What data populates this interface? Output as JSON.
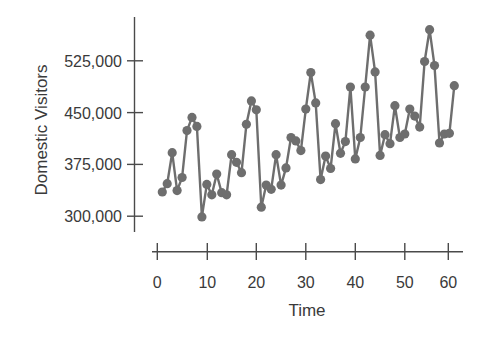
{
  "chart_data": {
    "type": "line",
    "title": "",
    "xlabel": "Time",
    "ylabel": "Domestic Visitors",
    "xlim": [
      0,
      60
    ],
    "ylim": [
      300000,
      525000
    ],
    "x_ticks": [
      0,
      10,
      20,
      30,
      40,
      50,
      60
    ],
    "x_tick_labels": [
      "0",
      "10",
      "20",
      "30",
      "40",
      "50",
      "60"
    ],
    "y_ticks": [
      300000,
      375000,
      450000,
      525000
    ],
    "y_tick_labels": [
      "300,000",
      "375,000",
      "450,000",
      "525,000"
    ],
    "grid": false,
    "legend": null,
    "markers": "circle",
    "series": [
      {
        "name": "Domestic Visitors",
        "color": "#6e6e6e",
        "x": [
          1,
          2,
          3,
          4,
          5,
          6,
          7,
          8,
          9,
          10,
          11,
          12,
          13,
          14,
          15,
          16,
          17,
          18,
          19,
          20,
          21,
          22,
          23,
          24,
          25,
          26,
          27,
          28,
          29,
          30,
          31,
          32,
          33,
          34,
          35,
          36,
          37,
          38,
          39,
          40,
          41,
          42,
          43,
          44,
          45,
          46,
          47,
          48,
          49,
          50,
          51,
          52,
          53,
          54,
          55,
          56,
          57,
          58,
          59,
          60
        ],
        "values": [
          335000,
          347000,
          392000,
          337000,
          356000,
          424000,
          443000,
          430000,
          299000,
          346000,
          331000,
          361000,
          334000,
          331000,
          389000,
          378000,
          363000,
          433000,
          467000,
          454000,
          313000,
          345000,
          339000,
          389000,
          345000,
          370000,
          414000,
          409000,
          395000,
          455000,
          508000,
          464000,
          353000,
          387000,
          369000,
          434000,
          391000,
          408000,
          487000,
          383000,
          414000,
          487000,
          562000,
          509000,
          388000,
          418000,
          405000,
          460000,
          414000,
          419000,
          455000,
          445000,
          429000,
          524000,
          570000,
          518000,
          406000,
          419000,
          420000,
          489000
        ]
      }
    ]
  },
  "layout": {
    "x_pixel_origin": 157.3,
    "x_pixel_per_unit": 4.95,
    "y_pixel_at_300000": 216.2,
    "y_pixel_per_75000": 51.8
  }
}
